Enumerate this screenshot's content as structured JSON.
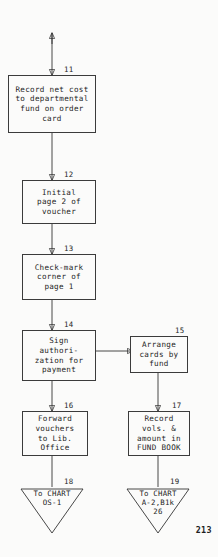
{
  "document": {
    "kind": "flowchart",
    "page_number": "213",
    "ink_color": "#242424",
    "paper_color": "#fbfbfa"
  },
  "nodes": [
    {
      "id": "node-11",
      "number": "11",
      "shape": "process",
      "lines": [
        "Record net cost",
        "to departmental",
        "fund on order",
        "card"
      ]
    },
    {
      "id": "node-12",
      "number": "12",
      "shape": "process",
      "lines": [
        "Initial",
        "page 2 of",
        "voucher"
      ]
    },
    {
      "id": "node-13",
      "number": "13",
      "shape": "process",
      "lines": [
        "Check-mark",
        "corner of",
        "page 1"
      ]
    },
    {
      "id": "node-14",
      "number": "14",
      "shape": "process",
      "lines": [
        "Sign",
        "authori-",
        "zation for",
        "payment"
      ]
    },
    {
      "id": "node-15",
      "number": "15",
      "shape": "process",
      "lines": [
        "Arrange",
        "cards by",
        "fund"
      ]
    },
    {
      "id": "node-16",
      "number": "16",
      "shape": "process",
      "lines": [
        "Forward",
        "vouchers",
        "to Lib.",
        "Office"
      ]
    },
    {
      "id": "node-17",
      "number": "17",
      "shape": "process",
      "lines": [
        "Record",
        "vols. &",
        "amount in",
        "FUND BOOK"
      ]
    },
    {
      "id": "node-18",
      "number": "18",
      "shape": "terminator",
      "lines": [
        "To CHART",
        "OS-1"
      ]
    },
    {
      "id": "node-19",
      "number": "19",
      "shape": "terminator",
      "lines": [
        "To CHART",
        "A-2,B1k",
        "26"
      ]
    }
  ]
}
